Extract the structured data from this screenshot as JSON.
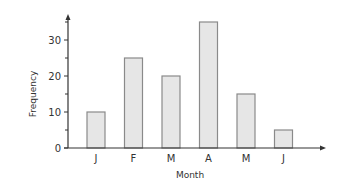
{
  "chart_data": {
    "type": "bar",
    "title": "",
    "xlabel": "Month",
    "ylabel": "Frequency",
    "categories": [
      "J",
      "F",
      "M",
      "A",
      "M",
      "J"
    ],
    "values": [
      10,
      25,
      20,
      35,
      15,
      5
    ],
    "ylim": [
      0,
      37
    ],
    "yticks": [
      0,
      10,
      20,
      30
    ],
    "y_minor_ticks": [
      5,
      15,
      25,
      35
    ],
    "grid": false,
    "legend": null,
    "colors": {
      "bar_fill": "#e6e6e6",
      "bar_stroke": "#8a8a8a",
      "axis": "#333333"
    }
  }
}
